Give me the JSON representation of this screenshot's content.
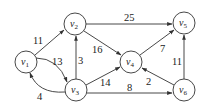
{
  "graph": {
    "nodes": [
      {
        "id": "v1",
        "label": "v",
        "sub": "1",
        "x": 26,
        "y": 62
      },
      {
        "id": "v2",
        "label": "v",
        "sub": "2",
        "x": 75,
        "y": 24
      },
      {
        "id": "v3",
        "label": "v",
        "sub": "3",
        "x": 76,
        "y": 90
      },
      {
        "id": "v4",
        "label": "v",
        "sub": "4",
        "x": 131,
        "y": 62
      },
      {
        "id": "v5",
        "label": "v",
        "sub": "5",
        "x": 184,
        "y": 23
      },
      {
        "id": "v6",
        "label": "v",
        "sub": "6",
        "x": 184,
        "y": 90
      }
    ],
    "edges": [
      {
        "from": "v1",
        "to": "v2",
        "weight": "11"
      },
      {
        "from": "v1",
        "to": "v3",
        "weight": "13"
      },
      {
        "from": "v3",
        "to": "v1",
        "weight": "4"
      },
      {
        "from": "v3",
        "to": "v2",
        "weight": "3"
      },
      {
        "from": "v2",
        "to": "v4",
        "weight": "16"
      },
      {
        "from": "v2",
        "to": "v5",
        "weight": "25"
      },
      {
        "from": "v3",
        "to": "v4",
        "weight": "14"
      },
      {
        "from": "v3",
        "to": "v6",
        "weight": "8"
      },
      {
        "from": "v4",
        "to": "v5",
        "weight": "7"
      },
      {
        "from": "v6",
        "to": "v4",
        "weight": "2"
      },
      {
        "from": "v6",
        "to": "v5",
        "weight": "11"
      }
    ]
  }
}
